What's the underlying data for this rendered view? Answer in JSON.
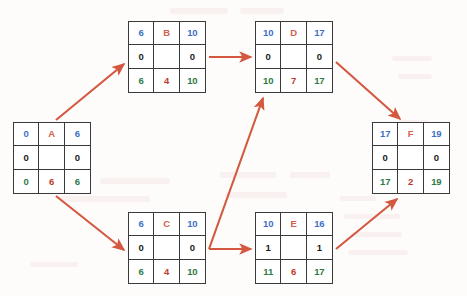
{
  "diagram": {
    "type": "activity-on-node-network",
    "node_legend": {
      "row1": [
        "early_start",
        "activity_name",
        "early_finish"
      ],
      "row2": [
        "free_slack",
        "",
        "total_slack"
      ],
      "row3": [
        "late_start",
        "duration",
        "late_finish"
      ]
    },
    "colors": {
      "early": "#3f6fc4",
      "name": "#d2604e",
      "slack": "#1b1b1b",
      "late": "#2e7a45",
      "duration": "#c0392b",
      "arrow": "#d3583f",
      "border": "#3a3a3a",
      "background": "#fdfcfb"
    }
  },
  "nodes": [
    {
      "id": "A",
      "name": "A",
      "early_start": "0",
      "early_finish": "6",
      "free_slack": "0",
      "total_slack": "0",
      "late_start": "0",
      "duration": "6",
      "late_finish": "6",
      "x": 13,
      "y": 122,
      "w": 78,
      "h": 72
    },
    {
      "id": "B",
      "name": "B",
      "early_start": "6",
      "early_finish": "10",
      "free_slack": "0",
      "total_slack": "0",
      "late_start": "6",
      "duration": "4",
      "late_finish": "10",
      "x": 128,
      "y": 21,
      "w": 78,
      "h": 72
    },
    {
      "id": "C",
      "name": "C",
      "early_start": "6",
      "early_finish": "10",
      "free_slack": "0",
      "total_slack": "0",
      "late_start": "6",
      "duration": "4",
      "late_finish": "10",
      "x": 128,
      "y": 212,
      "w": 78,
      "h": 72
    },
    {
      "id": "D",
      "name": "D",
      "early_start": "10",
      "early_finish": "17",
      "free_slack": "0",
      "total_slack": "0",
      "late_start": "10",
      "duration": "7",
      "late_finish": "17",
      "x": 255,
      "y": 21,
      "w": 78,
      "h": 72
    },
    {
      "id": "E",
      "name": "E",
      "early_start": "10",
      "early_finish": "16",
      "free_slack": "1",
      "total_slack": "1",
      "late_start": "11",
      "duration": "6",
      "late_finish": "17",
      "x": 255,
      "y": 212,
      "w": 78,
      "h": 72
    },
    {
      "id": "F",
      "name": "F",
      "early_start": "17",
      "early_finish": "19",
      "free_slack": "0",
      "total_slack": "0",
      "late_start": "17",
      "duration": "2",
      "late_finish": "19",
      "x": 372,
      "y": 122,
      "w": 78,
      "h": 72
    }
  ],
  "edges": [
    {
      "from": "A",
      "to": "B",
      "x1": 56,
      "y1": 120,
      "x2": 124,
      "y2": 64
    },
    {
      "from": "A",
      "to": "C",
      "x1": 56,
      "y1": 196,
      "x2": 124,
      "y2": 250
    },
    {
      "from": "B",
      "to": "D",
      "x1": 209,
      "y1": 57,
      "x2": 251,
      "y2": 57
    },
    {
      "from": "C",
      "to": "D",
      "x1": 209,
      "y1": 248,
      "x2": 262,
      "y2": 97
    },
    {
      "from": "C",
      "to": "E",
      "x1": 209,
      "y1": 248,
      "x2": 251,
      "y2": 248
    },
    {
      "from": "D",
      "to": "F",
      "x1": 336,
      "y1": 62,
      "x2": 398,
      "y2": 118
    },
    {
      "from": "E",
      "to": "F",
      "x1": 336,
      "y1": 248,
      "x2": 396,
      "y2": 198
    }
  ]
}
